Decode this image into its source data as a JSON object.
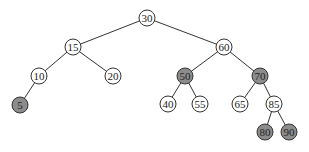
{
  "diagram": {
    "type": "binary-search-tree",
    "colors": {
      "white_fill": "#ffffff",
      "shaded_fill": "#8c8c8c",
      "stroke": "#333333"
    },
    "nodes": [
      {
        "id": "n30",
        "label": "30",
        "x": 147,
        "y": 18,
        "shaded": false
      },
      {
        "id": "n15",
        "label": "15",
        "x": 73,
        "y": 47,
        "shaded": false
      },
      {
        "id": "n60",
        "label": "60",
        "x": 224,
        "y": 47,
        "shaded": false
      },
      {
        "id": "n10",
        "label": "10",
        "x": 39,
        "y": 76,
        "shaded": false
      },
      {
        "id": "n20",
        "label": "20",
        "x": 113,
        "y": 76,
        "shaded": false
      },
      {
        "id": "n50",
        "label": "50",
        "x": 185,
        "y": 76,
        "shaded": true
      },
      {
        "id": "n70",
        "label": "70",
        "x": 260,
        "y": 76,
        "shaded": true
      },
      {
        "id": "n5",
        "label": "5",
        "x": 20,
        "y": 105,
        "shaded": true
      },
      {
        "id": "n40",
        "label": "40",
        "x": 168,
        "y": 104,
        "shaded": false
      },
      {
        "id": "n55",
        "label": "55",
        "x": 200,
        "y": 104,
        "shaded": false
      },
      {
        "id": "n65",
        "label": "65",
        "x": 240,
        "y": 104,
        "shaded": false
      },
      {
        "id": "n85",
        "label": "85",
        "x": 274,
        "y": 104,
        "shaded": false
      },
      {
        "id": "n80",
        "label": "80",
        "x": 265,
        "y": 132,
        "shaded": true
      },
      {
        "id": "n90",
        "label": "90",
        "x": 289,
        "y": 132,
        "shaded": true
      }
    ],
    "edges": [
      [
        "n30",
        "n15"
      ],
      [
        "n30",
        "n60"
      ],
      [
        "n15",
        "n10"
      ],
      [
        "n15",
        "n20"
      ],
      [
        "n10",
        "n5"
      ],
      [
        "n60",
        "n50"
      ],
      [
        "n60",
        "n70"
      ],
      [
        "n50",
        "n40"
      ],
      [
        "n50",
        "n55"
      ],
      [
        "n70",
        "n65"
      ],
      [
        "n70",
        "n85"
      ],
      [
        "n85",
        "n80"
      ],
      [
        "n85",
        "n90"
      ]
    ]
  }
}
